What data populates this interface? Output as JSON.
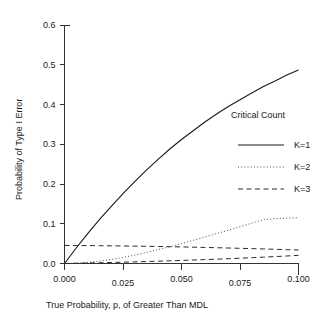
{
  "chart_data": {
    "type": "line",
    "title": "",
    "xlabel": "True Probability, p, of Greater Than MDL",
    "ylabel": "Probability of Type I Error",
    "xlim": [
      0.0,
      0.1
    ],
    "ylim": [
      0.0,
      0.6
    ],
    "grid": false,
    "xticks": [
      0.0,
      0.025,
      0.05,
      0.075,
      0.1
    ],
    "xtick_labels": [
      "0.000",
      "0.025",
      "0.050",
      "0.075",
      "0.100"
    ],
    "yticks": [
      0.0,
      0.1,
      0.2,
      0.3,
      0.4,
      0.5,
      0.6
    ],
    "ytick_labels": [
      "0.0",
      "0.1",
      "0.2",
      "0.3",
      "0.4",
      "0.5",
      "0.6"
    ],
    "legend_title": "Critical Count",
    "legend_position": "inside-right",
    "x": [
      0.0,
      0.005,
      0.01,
      0.015,
      0.02,
      0.025,
      0.03,
      0.035,
      0.04,
      0.045,
      0.05,
      0.055,
      0.06,
      0.065,
      0.07,
      0.075,
      0.08,
      0.085,
      0.09,
      0.095,
      0.1
    ],
    "series": [
      {
        "name": "K=1",
        "style": "solid",
        "values": [
          0.0,
          0.039,
          0.076,
          0.111,
          0.144,
          0.176,
          0.206,
          0.235,
          0.262,
          0.288,
          0.312,
          0.334,
          0.356,
          0.376,
          0.395,
          0.412,
          0.429,
          0.445,
          0.459,
          0.474,
          0.487
        ]
      },
      {
        "name": "K=2",
        "style": "dotted",
        "values": [
          0.0,
          0.0008,
          0.0028,
          0.006,
          0.0102,
          0.0153,
          0.0212,
          0.0277,
          0.0348,
          0.0423,
          0.0501,
          0.0583,
          0.0666,
          0.0752,
          0.0838,
          0.0926,
          0.1014,
          0.1102,
          0.1129,
          0.1142,
          0.1153
        ]
      },
      {
        "name": "K=3",
        "style": "dashed",
        "values": [
          0.0455,
          0.0452,
          0.045,
          0.0447,
          0.0444,
          0.0441,
          0.0437,
          0.0433,
          0.0428,
          0.0423,
          0.0417,
          0.0411,
          0.0404,
          0.0397,
          0.039,
          0.0382,
          0.0374,
          0.0366,
          0.0357,
          0.0348,
          0.0339
        ]
      },
      {
        "name": "K=3-lower",
        "style": "dashed",
        "values": [
          0.0,
          0.0006,
          0.0013,
          0.0019,
          0.0026,
          0.0033,
          0.0041,
          0.0049,
          0.0058,
          0.0067,
          0.0077,
          0.0087,
          0.0098,
          0.0109,
          0.0121,
          0.0133,
          0.0146,
          0.016,
          0.0174,
          0.0189,
          0.0205
        ]
      }
    ],
    "legend_entries": [
      {
        "label": "K=1",
        "style": "solid"
      },
      {
        "label": "K=2",
        "style": "dotted"
      },
      {
        "label": "K=3",
        "style": "dashed"
      }
    ]
  }
}
